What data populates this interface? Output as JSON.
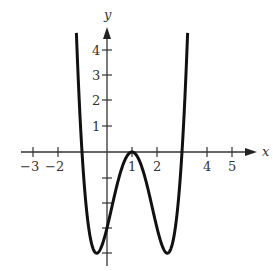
{
  "chart_data": {
    "type": "line",
    "title": "",
    "xlabel": "x",
    "ylabel": "y",
    "xlim": [
      -3.5,
      6
    ],
    "ylim": [
      -4.5,
      4.7
    ],
    "grid": false,
    "x_ticks": [
      -3,
      -2,
      1,
      2,
      4,
      5
    ],
    "x_tick_labels": [
      "−3",
      "−2",
      "1",
      "2",
      "4",
      "5"
    ],
    "x_ticks_unlabeled": [],
    "y_ticks": [
      4,
      3,
      2,
      1,
      -1,
      -2,
      -3,
      -4
    ],
    "y_tick_labels": [
      "4",
      "3",
      "2",
      "1",
      "",
      "",
      "",
      ""
    ],
    "series": [
      {
        "name": "f(x)",
        "description": "W-shaped quartic, approx f(x) = (x-1)^4 - 4(x-1)^2",
        "x": [
          -1.2,
          -1.0,
          -0.75,
          -0.5,
          -0.41,
          -0.25,
          0,
          0.25,
          0.5,
          0.75,
          1,
          1.25,
          1.5,
          1.75,
          2,
          2.25,
          2.41,
          2.5,
          2.75,
          3.0,
          3.2
        ],
        "y": [
          4.0,
          0.0,
          -2.87,
          -3.94,
          -4.0,
          -3.81,
          -3.0,
          -1.93,
          -0.94,
          -0.25,
          0.0,
          -0.25,
          -0.94,
          -1.93,
          -3.0,
          -3.81,
          -4.0,
          -3.94,
          -2.87,
          0.0,
          4.0
        ]
      }
    ],
    "key_points": {
      "local_max": [
        1,
        0
      ],
      "local_min": [
        [
          -0.41,
          -4
        ],
        [
          2.41,
          -4
        ]
      ],
      "x_intercepts": [
        -1,
        1,
        3
      ],
      "y_intercept": -3
    }
  },
  "labels": {
    "x_axis": "x",
    "y_axis": "y",
    "xt": [
      "−3",
      "−2",
      "1",
      "2",
      "4",
      "5"
    ],
    "yt": [
      "4",
      "3",
      "2",
      "1"
    ]
  }
}
